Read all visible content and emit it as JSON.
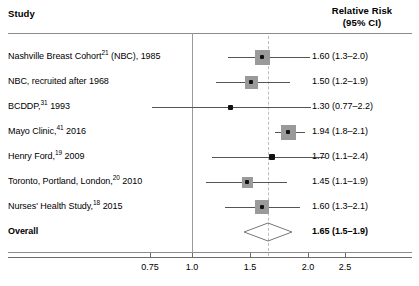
{
  "chart_data": {
    "type": "forest",
    "title": "",
    "xlabel": "",
    "ylabel": "",
    "columns": {
      "study_header": "Study",
      "rr_header_line1": "Relative Risk",
      "rr_header_line2": "(95% CI)"
    },
    "axis": {
      "tick_labels": [
        "0.75",
        "1.0",
        "1.5",
        "2.0",
        "2.5"
      ],
      "tick_values": [
        0.75,
        1.0,
        1.5,
        2.0,
        2.5
      ],
      "tick_x": [
        150,
        192,
        250,
        308,
        345
      ],
      "null_line_value": 1.0,
      "null_line_x": 192,
      "pooled_line_value": 1.65,
      "pooled_line_x": 268
    },
    "studies": [
      {
        "label_html": "Nashville Breast Cohort<sup>21</sup> (NBC), 1985",
        "rr": 1.6,
        "ci_low": 1.3,
        "ci_high": 2.0,
        "rr_text": "1.60 (1.3–2.0)",
        "marker": "square",
        "marker_size": 15,
        "x_center": 262,
        "x_low": 228,
        "x_high": 310,
        "row_y": 57
      },
      {
        "label_html": "NBC, recruited after 1968",
        "rr": 1.5,
        "ci_low": 1.2,
        "ci_high": 1.9,
        "rr_text": "1.50 (1.2–1.9)",
        "marker": "square",
        "marker_size": 13,
        "x_center": 251,
        "x_low": 216,
        "x_high": 290,
        "row_y": 82
      },
      {
        "label_html": "BCDDP,<sup>31</sup> 1993",
        "rr": 1.3,
        "ci_low": 0.77,
        "ci_high": 2.2,
        "rr_text": "1.30 (0.77–2.2)",
        "marker": "dot",
        "marker_size": 5,
        "x_center": 230,
        "x_low": 152,
        "x_high": 311,
        "row_y": 107
      },
      {
        "label_html": "Mayo Clinic,<sup>41</sup> 2016",
        "rr": 1.94,
        "ci_low": 1.8,
        "ci_high": 2.1,
        "rr_text": "1.94 (1.8–2.1)",
        "marker": "square",
        "marker_size": 15,
        "x_center": 288,
        "x_low": 275,
        "x_high": 305,
        "row_y": 132
      },
      {
        "label_html": "Henry Ford,<sup>19</sup> 2009",
        "rr": 1.7,
        "ci_low": 1.1,
        "ci_high": 2.4,
        "rr_text": "1.70 (1.1–2.4)",
        "marker": "dot",
        "marker_size": 6,
        "x_center": 272,
        "x_low": 212,
        "x_high": 325,
        "row_y": 157
      },
      {
        "label_html": "Toronto, Portland, London,<sup>20</sup> 2010",
        "rr": 1.45,
        "ci_low": 1.1,
        "ci_high": 1.9,
        "rr_text": "1.45 (1.1–1.9)",
        "marker": "square",
        "marker_size": 11,
        "x_center": 247,
        "x_low": 206,
        "x_high": 287,
        "row_y": 182
      },
      {
        "label_html": "Nurses' Health Study,<sup>18</sup> 2015",
        "rr": 1.6,
        "ci_low": 1.3,
        "ci_high": 2.1,
        "rr_text": "1.60 (1.3–2.1)",
        "marker": "square",
        "marker_size": 14,
        "x_center": 262,
        "x_low": 225,
        "x_high": 300,
        "row_y": 207
      }
    ],
    "overall": {
      "label": "Overall",
      "rr": 1.65,
      "ci_low": 1.5,
      "ci_high": 1.9,
      "rr_text": "1.65 (1.5–1.9)",
      "marker": "diamond",
      "x_center": 268,
      "x_low": 244,
      "x_high": 292,
      "row_y": 232
    },
    "colors": {
      "marker_square": "#9a9a9a",
      "marker_dot": "#111111",
      "ci_line": "#555555",
      "null_line": "#9a9a9a",
      "pooled_line": "#bdbdbd",
      "rule": "#8c8c8c",
      "axis": "#6b6b6b",
      "text": "#000000",
      "background": "#ffffff"
    }
  }
}
